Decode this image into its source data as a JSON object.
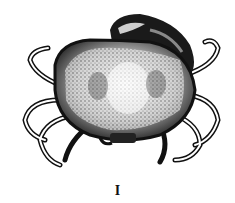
{
  "figure": {
    "caption": "I",
    "colors": {
      "ink": "#111111",
      "paper": "#ffffff",
      "shade": "#555555"
    }
  }
}
